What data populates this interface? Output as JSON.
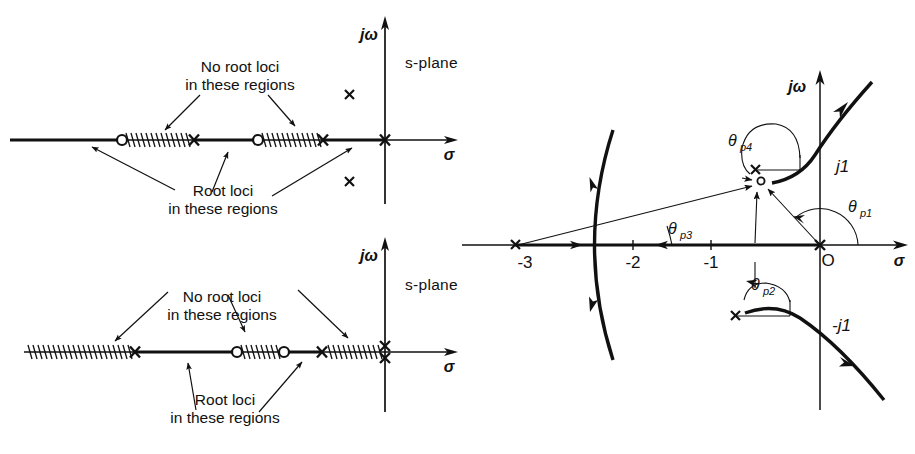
{
  "figure": {
    "background_color": "#ffffff",
    "stroke_color": "#111111"
  },
  "panel_top_left": {
    "name": "real-axis-root-loci-case-1",
    "plane_label": "s-plane",
    "axis_imag_label": "jω",
    "axis_real_label": "σ",
    "annotation_no_loci_line1": "No root loci",
    "annotation_no_loci_line2": "in these regions",
    "annotation_loci_line1": "Root loci",
    "annotation_loci_line2": "in these regions",
    "markers": [
      {
        "type": "zero",
        "symbol": "○",
        "x_px": 122
      },
      {
        "type": "pole",
        "symbol": "×",
        "x_px": 194
      },
      {
        "type": "zero",
        "symbol": "○",
        "x_px": 258
      },
      {
        "type": "pole",
        "symbol": "×",
        "x_px": 323
      },
      {
        "type": "pole",
        "symbol": "×",
        "x_px": 385
      }
    ],
    "complex_poles": [
      {
        "symbol": "×",
        "x_px": 349,
        "y_px": 94
      },
      {
        "symbol": "×",
        "x_px": 349,
        "y_px": 181
      }
    ],
    "hatched_segments": [
      [
        124,
        190
      ],
      [
        261,
        319
      ]
    ],
    "loci_segments": [
      [
        10,
        122
      ],
      [
        194,
        258
      ],
      [
        323,
        385
      ]
    ]
  },
  "panel_bottom_left": {
    "name": "real-axis-root-loci-case-2",
    "plane_label": "s-plane",
    "axis_imag_label": "jω",
    "axis_real_label": "σ",
    "annotation_no_loci_line1": "No root loci",
    "annotation_no_loci_line2": "in these regions",
    "annotation_loci_line1": "Root loci",
    "annotation_loci_line2": "in these regions",
    "markers": [
      {
        "type": "pole",
        "symbol": "×",
        "x_px": 135
      },
      {
        "type": "zero",
        "symbol": "○",
        "x_px": 237
      },
      {
        "type": "zero",
        "symbol": "○",
        "x_px": 284
      },
      {
        "type": "pole",
        "symbol": "×",
        "x_px": 322
      },
      {
        "type": "double-pole",
        "symbol": "×",
        "x_px": 385
      }
    ],
    "hatched_segments": [
      [
        28,
        131
      ],
      [
        240,
        281
      ],
      [
        327,
        381
      ]
    ],
    "loci_segments": [
      [
        135,
        237
      ],
      [
        284,
        322
      ]
    ]
  },
  "panel_right": {
    "name": "angle-of-departure-root-locus",
    "axis_imag_label": "jω",
    "axis_real_label": "σ",
    "tick_labels": [
      {
        "text": "-3",
        "x_px": 525,
        "y_px": 264
      },
      {
        "text": "-2",
        "x_px": 633,
        "y_px": 264
      },
      {
        "text": "-1",
        "x_px": 711,
        "y_px": 264
      },
      {
        "text": "O",
        "x_px": 826,
        "y_px": 262
      }
    ],
    "imag_labels": [
      {
        "text": "j1",
        "x_px": 843,
        "y_px": 166
      },
      {
        "text": "-j1",
        "x_px": 841,
        "y_px": 326
      }
    ],
    "angle_labels": [
      {
        "base": "θ",
        "sub": "p1",
        "x_px": 858,
        "y_px": 209
      },
      {
        "base": "θ",
        "sub": "p2",
        "x_px": 756,
        "y_px": 288
      },
      {
        "base": "θ",
        "sub": "p3",
        "x_px": 672,
        "y_px": 232
      },
      {
        "base": "θ",
        "sub": "p4",
        "x_px": 735,
        "y_px": 144
      }
    ],
    "poles": [
      {
        "symbol": "×",
        "label": "-3",
        "x_px": 515,
        "y_px": 245
      },
      {
        "symbol": "×",
        "label": "O",
        "x_px": 820,
        "y_px": 245
      },
      {
        "symbol": "×",
        "label": "-1+j1",
        "x_px": 755,
        "y_px": 170
      },
      {
        "symbol": "×",
        "label": "-1-j1",
        "x_px": 735,
        "y_px": 316
      }
    ],
    "test_point_x_px": 760,
    "test_point_y_px": 180
  }
}
